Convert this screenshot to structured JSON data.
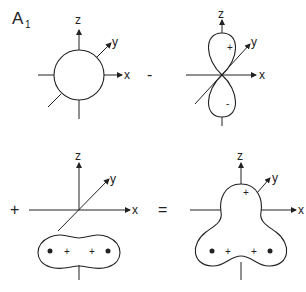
{
  "title": {
    "main": "A",
    "subscript": "1"
  },
  "axes": {
    "x": "x",
    "y": "y",
    "z": "z"
  },
  "operators": {
    "minus": "-",
    "plus": "+",
    "equals": "="
  },
  "panels": [
    {
      "name": "s-orbital",
      "shape": "sphere",
      "signs": []
    },
    {
      "name": "pz-orbital",
      "shape": "dumbbell",
      "signs": [
        "+",
        "-"
      ]
    },
    {
      "name": "ligand-combination",
      "shape": "peanut",
      "signs": [
        "+",
        "+"
      ],
      "atoms": 2
    },
    {
      "name": "result-hybrid",
      "shape": "trilobe",
      "signs": [
        "+",
        "+",
        "+"
      ],
      "atoms": 2
    }
  ],
  "colors": {
    "line": "#222222",
    "background": "#ffffff"
  }
}
